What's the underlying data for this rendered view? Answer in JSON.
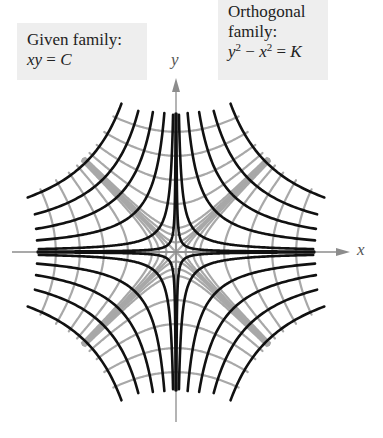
{
  "labels": {
    "given": {
      "line1": "Given family:",
      "equation": {
        "lhs": "xy",
        "eq": "=",
        "rhs": "C"
      }
    },
    "orthogonal": {
      "line1": "Orthogonal",
      "line2": "family:",
      "equation": {
        "a": "y",
        "a_exp": "2",
        "minus": "−",
        "b": "x",
        "b_exp": "2",
        "eq": "=",
        "rhs": "K"
      }
    },
    "x_axis": "x",
    "y_axis": "y"
  },
  "colors": {
    "given_curves": "#111111",
    "orthogonal_curves": "#a8a8a8",
    "axes": "#8c8c8c",
    "label_box": "#eeeeee"
  },
  "chart_data": {
    "type": "diagram",
    "given_family": {
      "equation": "xy = C",
      "C_values": [
        0.05,
        0.35,
        1.4,
        2.8,
        4.6,
        7.0,
        -0.05,
        -0.35,
        -1.4,
        -2.8,
        -4.6,
        -7.0
      ]
    },
    "orthogonal_family": {
      "equation": "y^2 - x^2 = K",
      "K_values": [
        0,
        0.08,
        0.25,
        0.5,
        2,
        4.5,
        8,
        12.5,
        -0.08,
        -0.25,
        -0.5,
        -2,
        -4.5,
        -8,
        -12.5
      ]
    },
    "region": {
      "max_abs_C": 7.5,
      "max_abs_K": 16.7
    },
    "axes": {
      "origin_px": [
        176,
        252
      ],
      "scale_px_per_unit": 34,
      "x_range_px": [
        12,
        350
      ],
      "y_range_px": [
        78,
        422
      ],
      "xlabel": "x",
      "ylabel": "y"
    }
  }
}
